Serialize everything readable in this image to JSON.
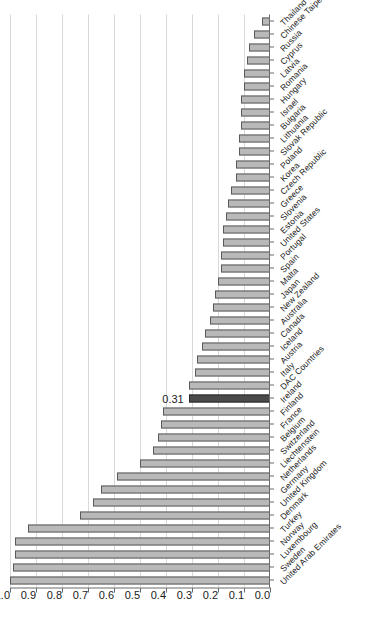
{
  "chart_data": {
    "type": "bar",
    "orientation": "horizontal",
    "title": "",
    "subtitle": "",
    "xlabel": "",
    "ylabel": "",
    "ylim": [
      0.0,
      1.0
    ],
    "grid": true,
    "legend": "none",
    "tick_labels": [
      "0.0",
      "0.1",
      "0.2",
      "0.3",
      "0.4",
      "0.5",
      "0.6",
      "0.7",
      "0.8",
      "0.9",
      "1.0"
    ],
    "tick_values": [
      0.0,
      0.1,
      0.2,
      0.3,
      0.4,
      0.5,
      0.6,
      0.7,
      0.8,
      0.9,
      1.0
    ],
    "highlight_category": "Ireland",
    "highlight_label": "0.31",
    "bar_color": "#b9b9b9",
    "bar_edge_color": "#5a5a5a",
    "highlight_color": "#4a4a4a",
    "highlight_edge_color": "#2b2b2b",
    "grid_color": "#d9d9d9",
    "axis_color": "#6b6b6b",
    "categories": [
      "United Arab Emirates",
      "Sweden",
      "Luxembourg",
      "Norway",
      "Turkey",
      "Denmark",
      "United Kingdom",
      "Germany",
      "Netherlands",
      "Liechtenstein",
      "Switzerland",
      "Belgium",
      "France",
      "Finland",
      "Ireland",
      "DAC Countries",
      "Italy",
      "Austria",
      "Iceland",
      "Canada",
      "Australia",
      "New Zealand",
      "Japan",
      "Malta",
      "Spain",
      "Portugal",
      "United States",
      "Estonia",
      "Slovenia",
      "Greece",
      "Czech Republic",
      "Korea",
      "Poland",
      "Slovak Republic",
      "Lithuania",
      "Bulgaria",
      "Israel",
      "Hungary",
      "Romania",
      "Latvia",
      "Cyprus",
      "Russia",
      "Chinese Taipei",
      "Thailand"
    ],
    "values": [
      1.0,
      0.99,
      0.98,
      0.98,
      0.93,
      0.73,
      0.68,
      0.65,
      0.59,
      0.5,
      0.45,
      0.43,
      0.42,
      0.41,
      0.31,
      0.31,
      0.29,
      0.28,
      0.26,
      0.25,
      0.23,
      0.22,
      0.21,
      0.2,
      0.19,
      0.19,
      0.18,
      0.18,
      0.17,
      0.16,
      0.15,
      0.13,
      0.13,
      0.12,
      0.12,
      0.11,
      0.11,
      0.11,
      0.1,
      0.1,
      0.09,
      0.08,
      0.06,
      0.03
    ]
  }
}
